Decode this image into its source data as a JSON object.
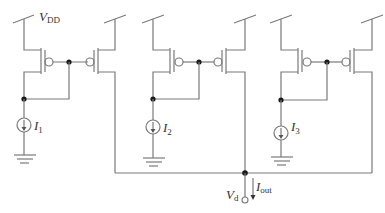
{
  "diagram": {
    "type": "circuit-schematic",
    "supply_label": {
      "main": "V",
      "sub": "DD"
    },
    "current_sources": [
      {
        "main": "I",
        "sub": "1"
      },
      {
        "main": "I",
        "sub": "2"
      },
      {
        "main": "I",
        "sub": "3"
      }
    ],
    "output_node": {
      "main": "V",
      "sub": "d"
    },
    "output_current": {
      "main": "I",
      "sub": "out"
    },
    "colors": {
      "wire": "#7a7a7a",
      "node": "#1a1a1a",
      "text": "#333333"
    }
  }
}
